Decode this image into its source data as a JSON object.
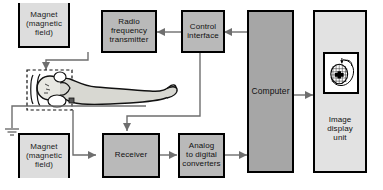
{
  "diagram": {
    "type": "block-diagram",
    "background_color": "#ffffff",
    "line_color": "#6e6e6e",
    "outline_color": "#000000"
  },
  "nodes": {
    "magnet_top": {
      "label": "Magnet\n(magnetic\nfield)",
      "fill": "#dddddd",
      "shape": "open-top-rect"
    },
    "magnet_bottom": {
      "label": "Magnet\n(magnetic\nfield)",
      "fill": "#dddddd",
      "shape": "open-bottom-rect"
    },
    "rf_transmitter": {
      "label": "Radio\nfrequency\ntransmitter",
      "fill": "#b9b9b9",
      "shape": "rect"
    },
    "control_interface": {
      "label": "Control\ninterface",
      "fill": "#b9b9b9",
      "shape": "rect"
    },
    "computer": {
      "label": "Computer",
      "fill": "#a6a6a6",
      "shape": "rect"
    },
    "image_display_unit": {
      "label": "Image\ndisplay\nunit",
      "fill": "#e2e2e2",
      "shape": "rect"
    },
    "receiver": {
      "label": "Receiver",
      "fill": "#b9b9b9",
      "shape": "rect"
    },
    "adc": {
      "label": "Analog\nto digital\nconverters",
      "fill": "#b9b9b9",
      "shape": "rect"
    },
    "patient": {
      "label": "",
      "description": "patient lying supine inside head coil"
    },
    "head_coil": {
      "label": "",
      "description": "dashed rectangle around patient head"
    },
    "ground": {
      "label": "",
      "description": "electrical ground symbol"
    },
    "scan_image": {
      "label": "",
      "description": "axial head scan with grid overlay and lesion"
    }
  },
  "connections": [
    {
      "from": "control_interface",
      "to": "rf_transmitter",
      "arrow": "left"
    },
    {
      "from": "computer",
      "to": "control_interface",
      "arrow": "left"
    },
    {
      "from": "rf_transmitter",
      "to": "head_coil",
      "arrow": "down"
    },
    {
      "from": "control_interface",
      "to": "receiver",
      "arrow": "down"
    },
    {
      "from": "head_coil",
      "to": "receiver",
      "arrow": "right"
    },
    {
      "from": "receiver",
      "to": "adc",
      "arrow": "right"
    },
    {
      "from": "adc",
      "to": "computer",
      "arrow": "right"
    },
    {
      "from": "computer",
      "to": "image_display_unit",
      "arrow": "right"
    },
    {
      "from": "patient_table",
      "to": "ground",
      "arrow": "none"
    }
  ]
}
